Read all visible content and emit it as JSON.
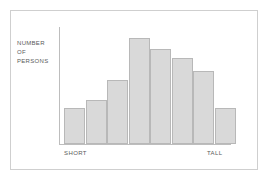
{
  "figure": {
    "frame_color": "#cfcfcf",
    "background": "#ffffff"
  },
  "axis": {
    "y_caption_line1": "NUMBER",
    "y_caption_line2": "OF",
    "y_caption_line3": "PERSONS",
    "x_label_left": "SHORT",
    "x_label_right": "TALL",
    "axis_line_color": "#bdbdbd"
  },
  "chart_data": {
    "type": "bar",
    "title": "",
    "subtitle": "",
    "xlabel": "",
    "ylabel": "NUMBER OF PERSONS",
    "categories": [
      "1",
      "2",
      "3",
      "4",
      "5",
      "6",
      "7",
      "8"
    ],
    "tick_labels": {
      "x_first": "SHORT",
      "x_last": "TALL"
    },
    "values": [
      36,
      44,
      64,
      106,
      95,
      86,
      73,
      36
    ],
    "ylim": [
      0,
      118
    ],
    "xlim": [
      0,
      8
    ],
    "grid": false,
    "legend": false,
    "legend_position": "none",
    "bar_fill": "#d9d9d9",
    "bar_border": "#b8b8b8",
    "bar_width_px": 21,
    "annotation": "Bell-shaped (normal) distribution of person heights from short to tall"
  }
}
